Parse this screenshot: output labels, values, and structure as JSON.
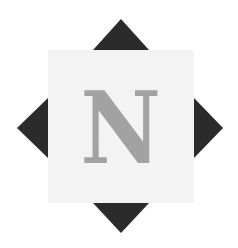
{
  "logo": {
    "letter": "N",
    "colors": {
      "background": "#ffffff",
      "square": "#f3f3f3",
      "triangles": "#2b2b2b",
      "letter": "#a2a2a2"
    }
  }
}
